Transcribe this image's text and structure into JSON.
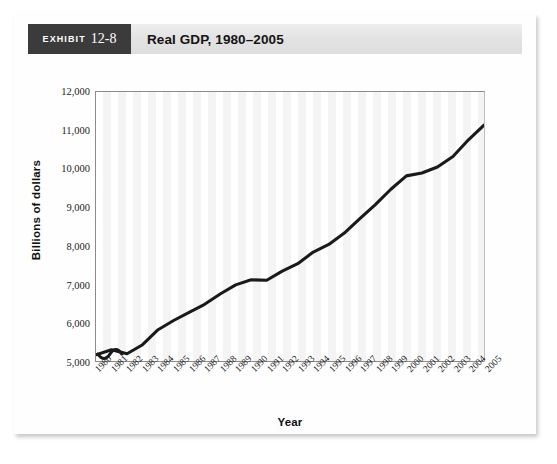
{
  "header": {
    "exhibit_word": "EXHIBIT",
    "exhibit_number": "12-8",
    "title": "Real GDP, 1980–2005"
  },
  "colors": {
    "badge_background": "#3b3b3b",
    "header_background": "#e3e3e3",
    "line": "#1a1a1a",
    "axis": "#8b8b8b",
    "stripe": "#f4f4f4",
    "card": "#fefefe"
  },
  "chart_data": {
    "type": "line",
    "title": "Real GDP, 1980–2005",
    "xlabel": "Year",
    "ylabel": "Billions of dollars",
    "ylim": [
      5000,
      12000
    ],
    "ytick_values": [
      12000,
      11000,
      10000,
      9000,
      8000,
      7000,
      6000,
      5000
    ],
    "ytick_labels": [
      "12,000",
      "11,000",
      "10,000",
      "9,000",
      "8,000",
      "7,000",
      "6,000",
      "5,000"
    ],
    "axis_break": true,
    "grid": false,
    "legend": "none",
    "categories": [
      "1980",
      "1981",
      "1982",
      "1983",
      "1984",
      "1985",
      "1986",
      "1987",
      "1988",
      "1989",
      "1990",
      "1991",
      "1992",
      "1993",
      "1994",
      "1995",
      "1996",
      "1997",
      "1998",
      "1999",
      "2000",
      "2001",
      "2002",
      "2003",
      "2004",
      "2005"
    ],
    "series": [
      {
        "name": "Real GDP",
        "values": [
          5162,
          5292,
          5189,
          5424,
          5814,
          6054,
          6264,
          6475,
          6743,
          6981,
          7113,
          7101,
          7337,
          7533,
          7836,
          8032,
          8329,
          8704,
          9067,
          9470,
          9817,
          9891,
          10049,
          10321,
          10756,
          11135
        ]
      }
    ]
  }
}
